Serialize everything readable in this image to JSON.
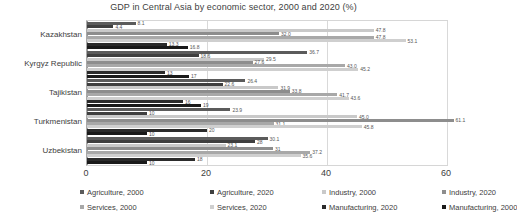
{
  "chart": {
    "title": "GDP in Central Asia by economic sector, 2000 and 2020 (%)"
  },
  "axis": {
    "ticks": [
      "0",
      "20",
      "40",
      "60"
    ]
  },
  "legend": {
    "items": [
      {
        "label": "Agriculture, 2000",
        "color": "#5b5b5b"
      },
      {
        "label": "Agriculture, 2020",
        "color": "#3f3f3f"
      },
      {
        "label": "Industry, 2000",
        "color": "#c9c9c9"
      },
      {
        "label": "Industry, 2020",
        "color": "#8d8d8d"
      },
      {
        "label": "Services, 2000",
        "color": "#a8a8a8"
      },
      {
        "label": "Services, 2020",
        "color": "#cfcfcf"
      },
      {
        "label": "Manufacturing, 2020",
        "color": "#2b2b2b"
      },
      {
        "label": "Manufacturing, 2000",
        "color": "#1a1a1a"
      }
    ]
  },
  "chart_data": {
    "type": "bar",
    "orientation": "horizontal",
    "title": "GDP in Central Asia by economic sector, 2000 and 2020 (%)",
    "xlabel": "",
    "ylabel": "",
    "xlim": [
      0,
      60
    ],
    "xticks": [
      0,
      20,
      40,
      60
    ],
    "grid": true,
    "legend_position": "bottom",
    "categories": [
      "Kazakhstan",
      "Kyrgyz Republic",
      "Tajikistan",
      "Turkmenistan",
      "Uzbekistan"
    ],
    "series": [
      {
        "name": "Agriculture, 2000",
        "color": "#5b5b5b",
        "values": [
          8.1,
          36.7,
          26.4,
          23.9,
          30.1
        ]
      },
      {
        "name": "Agriculture, 2020",
        "color": "#3f3f3f",
        "values": [
          4.4,
          18.6,
          22.6,
          10.0,
          28.0
        ]
      },
      {
        "name": "Industry, 2000",
        "color": "#c9c9c9",
        "values": [
          47.8,
          29.5,
          31.9,
          45.0,
          23.1
        ]
      },
      {
        "name": "Industry, 2020",
        "color": "#8d8d8d",
        "values": [
          32.0,
          27.6,
          33.8,
          61.1,
          31.0
        ]
      },
      {
        "name": "Services, 2000",
        "color": "#a8a8a8",
        "values": [
          47.8,
          43.0,
          41.7,
          31.1,
          37.2
        ]
      },
      {
        "name": "Services, 2020",
        "color": "#cfcfcf",
        "values": [
          53.1,
          45.2,
          43.6,
          45.8,
          35.6
        ]
      },
      {
        "name": "Manufacturing, 2020",
        "color": "#2b2b2b",
        "values": [
          13.3,
          13.0,
          16.0,
          20.0,
          18.0
        ]
      },
      {
        "name": "Manufacturing, 2000",
        "color": "#1a1a1a",
        "values": [
          16.8,
          17.0,
          19.0,
          10.0,
          10.0
        ]
      }
    ],
    "data_labels": [
      {
        "category": "Kazakhstan",
        "series": "Agriculture, 2000",
        "value": 8.1,
        "text": "8.1"
      },
      {
        "category": "Kazakhstan",
        "series": "Agriculture, 2020",
        "value": 4.4,
        "text": "4.4"
      },
      {
        "category": "Kazakhstan",
        "series": "Industry, 2000",
        "value": 47.8,
        "text": "47.8"
      },
      {
        "category": "Kazakhstan",
        "series": "Industry, 2020",
        "value": 32.0,
        "text": "32.0"
      },
      {
        "category": "Kazakhstan",
        "series": "Services, 2000",
        "value": 47.8,
        "text": "47.8"
      },
      {
        "category": "Kazakhstan",
        "series": "Services, 2020",
        "value": 53.1,
        "text": "53.1"
      },
      {
        "category": "Kazakhstan",
        "series": "Manufacturing, 2020",
        "value": 13.3,
        "text": "13.3"
      },
      {
        "category": "Kazakhstan",
        "series": "Manufacturing, 2000",
        "value": 16.8,
        "text": "16.8"
      },
      {
        "category": "Kyrgyz Republic",
        "series": "Agriculture, 2000",
        "value": 36.7,
        "text": "36.7"
      },
      {
        "category": "Kyrgyz Republic",
        "series": "Agriculture, 2020",
        "value": 18.6,
        "text": "18.6"
      },
      {
        "category": "Kyrgyz Republic",
        "series": "Industry, 2000",
        "value": 29.5,
        "text": "29.5"
      },
      {
        "category": "Kyrgyz Republic",
        "series": "Industry, 2020",
        "value": 27.6,
        "text": "27.6"
      },
      {
        "category": "Kyrgyz Republic",
        "series": "Services, 2000",
        "value": 43.0,
        "text": "43.0"
      },
      {
        "category": "Kyrgyz Republic",
        "series": "Services, 2020",
        "value": 45.2,
        "text": "45.2"
      },
      {
        "category": "Kyrgyz Republic",
        "series": "Manufacturing, 2020",
        "value": 13.0,
        "text": "13"
      },
      {
        "category": "Kyrgyz Republic",
        "series": "Manufacturing, 2000",
        "value": 17.0,
        "text": "17"
      },
      {
        "category": "Tajikistan",
        "series": "Agriculture, 2000",
        "value": 26.4,
        "text": "26.4"
      },
      {
        "category": "Tajikistan",
        "series": "Agriculture, 2020",
        "value": 22.6,
        "text": "22.6"
      },
      {
        "category": "Tajikistan",
        "series": "Industry, 2000",
        "value": 31.9,
        "text": "31.9"
      },
      {
        "category": "Tajikistan",
        "series": "Industry, 2020",
        "value": 33.8,
        "text": "33.8"
      },
      {
        "category": "Tajikistan",
        "series": "Services, 2000",
        "value": 41.7,
        "text": "41.7"
      },
      {
        "category": "Tajikistan",
        "series": "Services, 2020",
        "value": 43.6,
        "text": "43.6"
      },
      {
        "category": "Tajikistan",
        "series": "Manufacturing, 2020",
        "value": 16.0,
        "text": "16"
      },
      {
        "category": "Tajikistan",
        "series": "Manufacturing, 2000",
        "value": 19.0,
        "text": "19"
      },
      {
        "category": "Turkmenistan",
        "series": "Agriculture, 2000",
        "value": 23.9,
        "text": "23.9"
      },
      {
        "category": "Turkmenistan",
        "series": "Agriculture, 2020",
        "value": 10.0,
        "text": "10"
      },
      {
        "category": "Turkmenistan",
        "series": "Industry, 2000",
        "value": 45.0,
        "text": "45.0"
      },
      {
        "category": "Turkmenistan",
        "series": "Industry, 2020",
        "value": 61.1,
        "text": "61.1"
      },
      {
        "category": "Turkmenistan",
        "series": "Services, 2000",
        "value": 31.1,
        "text": "31.1"
      },
      {
        "category": "Turkmenistan",
        "series": "Services, 2020",
        "value": 45.8,
        "text": "45.8"
      },
      {
        "category": "Turkmenistan",
        "series": "Manufacturing, 2020",
        "value": 20.0,
        "text": "20"
      },
      {
        "category": "Turkmenistan",
        "series": "Manufacturing, 2000",
        "value": 10.0,
        "text": "10"
      },
      {
        "category": "Uzbekistan",
        "series": "Agriculture, 2000",
        "value": 30.1,
        "text": "30.1"
      },
      {
        "category": "Uzbekistan",
        "series": "Agriculture, 2020",
        "value": 28.0,
        "text": "28"
      },
      {
        "category": "Uzbekistan",
        "series": "Industry, 2000",
        "value": 23.1,
        "text": "23.1"
      },
      {
        "category": "Uzbekistan",
        "series": "Industry, 2020",
        "value": 31.0,
        "text": "31"
      },
      {
        "category": "Uzbekistan",
        "series": "Services, 2000",
        "value": 37.2,
        "text": "37.2"
      },
      {
        "category": "Uzbekistan",
        "series": "Services, 2020",
        "value": 35.6,
        "text": "35.6"
      },
      {
        "category": "Uzbekistan",
        "series": "Manufacturing, 2020",
        "value": 18.0,
        "text": "18"
      },
      {
        "category": "Uzbekistan",
        "series": "Manufacturing, 2000",
        "value": 10.0,
        "text": "10"
      }
    ]
  }
}
